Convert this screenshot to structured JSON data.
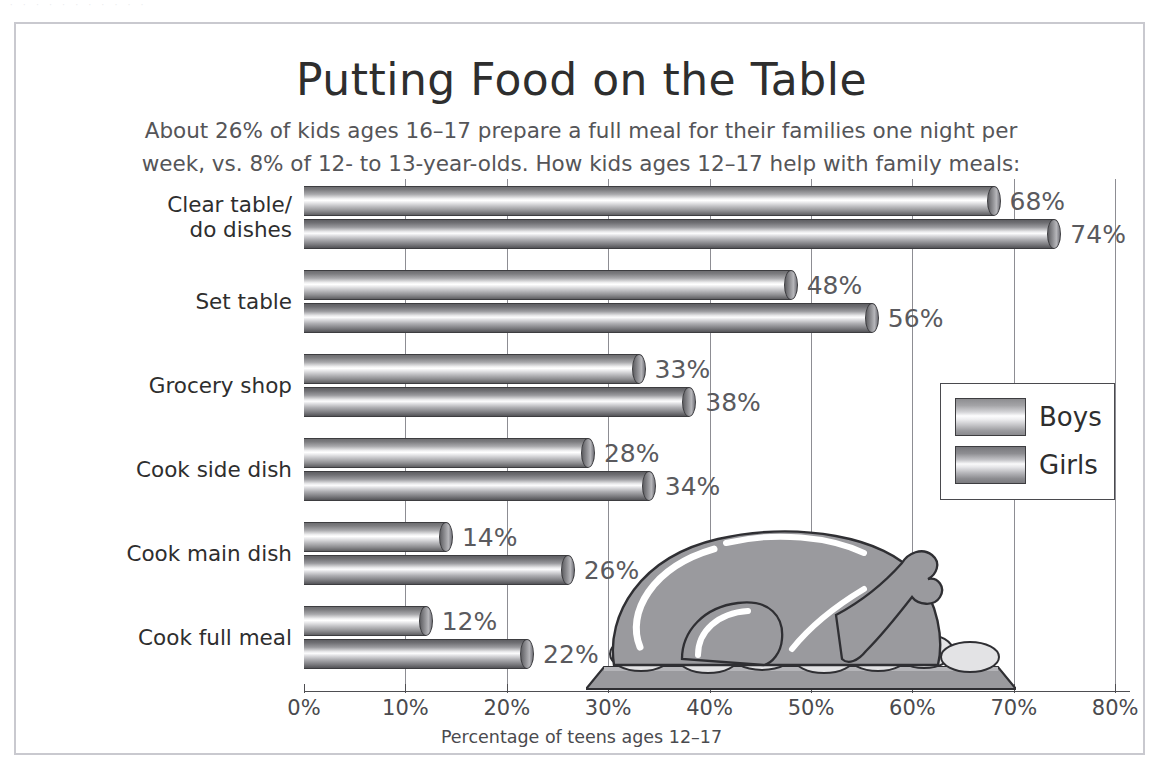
{
  "scan_remnant": "· · ·   · ·   · · · ·   · ·",
  "chart_data": {
    "type": "bar",
    "orientation": "horizontal",
    "title": "Putting Food on the Table",
    "subtitle": "About 26% of kids ages 16–17 prepare a full meal for their families one night per week, vs. 8% of 12- to 13-year-olds.  How kids ages 12–17 help with family meals:",
    "xlabel": "Percentage of teens ages 12–17",
    "ylabel": "",
    "xlim": [
      0,
      80
    ],
    "xticks": [
      "0%",
      "10%",
      "20%",
      "30%",
      "40%",
      "50%",
      "60%",
      "70%",
      "80%"
    ],
    "xtick_values": [
      0,
      10,
      20,
      30,
      40,
      50,
      60,
      70,
      80
    ],
    "grid": true,
    "legend_position": "right",
    "categories": [
      "Clear table/ do dishes",
      "Set table",
      "Grocery shop",
      "Cook side dish",
      "Cook main dish",
      "Cook full meal"
    ],
    "series": [
      {
        "name": "Boys",
        "values": [
          68,
          48,
          33,
          28,
          14,
          12
        ],
        "labels": [
          "68%",
          "48%",
          "33%",
          "28%",
          "14%",
          "12%"
        ]
      },
      {
        "name": "Girls",
        "values": [
          74,
          56,
          38,
          34,
          26,
          22
        ],
        "labels": [
          "74%",
          "56%",
          "38%",
          "34%",
          "26%",
          "22%"
        ]
      }
    ],
    "colors": {
      "boys": "#c9c9cc",
      "girls": "#b0b0b4",
      "text": "#4a4a4e",
      "title": "#2e2e2e",
      "grid": "#8d8d93",
      "frame": "#c9c9cf",
      "turkey": "#9a9a9e"
    },
    "annotation_image": "roast-turkey-on-platter"
  },
  "categories_display": [
    {
      "line1": "Clear table/",
      "line2": "do dishes"
    },
    {
      "line1": "Set table",
      "line2": ""
    },
    {
      "line1": "Grocery shop",
      "line2": ""
    },
    {
      "line1": "Cook side dish",
      "line2": ""
    },
    {
      "line1": "Cook main dish",
      "line2": ""
    },
    {
      "line1": "Cook full meal",
      "line2": ""
    }
  ],
  "legend": {
    "items": [
      {
        "label": "Boys"
      },
      {
        "label": "Girls"
      }
    ]
  }
}
